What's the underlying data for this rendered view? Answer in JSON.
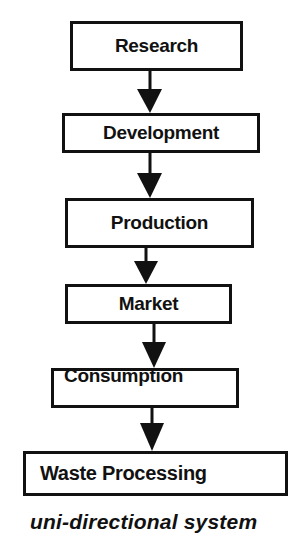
{
  "diagram": {
    "type": "flowchart",
    "direction": "top-to-bottom",
    "nodes": [
      {
        "id": "research",
        "label": "Research"
      },
      {
        "id": "development",
        "label": "Development"
      },
      {
        "id": "production",
        "label": "Production"
      },
      {
        "id": "market",
        "label": "Market"
      },
      {
        "id": "consumption",
        "label": "Consumption"
      },
      {
        "id": "waste",
        "label": "Waste Processing"
      }
    ],
    "edges": [
      {
        "from": "research",
        "to": "development"
      },
      {
        "from": "development",
        "to": "production"
      },
      {
        "from": "production",
        "to": "market"
      },
      {
        "from": "market",
        "to": "consumption"
      },
      {
        "from": "consumption",
        "to": "waste"
      }
    ],
    "caption": "uni-directional system"
  },
  "colors": {
    "stroke": "#111111",
    "background": "#ffffff"
  }
}
